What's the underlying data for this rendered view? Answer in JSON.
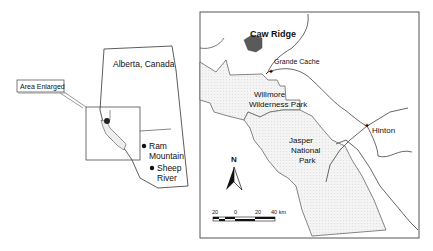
{
  "overview_map": {
    "province_label": "Alberta, Canada",
    "inset_label": "Area Enlarged",
    "sites": [
      {
        "line1": "Ram",
        "line2": "Mountain"
      },
      {
        "line1": "Sheep",
        "line2": "River"
      }
    ]
  },
  "detail_map": {
    "places": {
      "caw_ridge": "Caw Ridge",
      "grande_cache": "Grande Cache",
      "hinton": "Hinton"
    },
    "parks": {
      "willmore_1": "Willmore",
      "willmore_2": "Wilderness Park",
      "jasper_1": "Jasper",
      "jasper_2": "National",
      "jasper_3": "Park"
    },
    "north_arrow": "N",
    "scale_bar": {
      "ticks": [
        "20",
        "0",
        "20",
        "40 km"
      ]
    }
  },
  "colors": {
    "caw_ridge_fill": "#5a5a5a",
    "park_fill": "#f1f1f1",
    "line": "#555555"
  }
}
